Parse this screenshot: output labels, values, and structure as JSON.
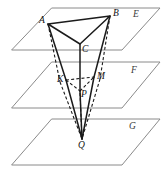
{
  "figure": {
    "type": "geometry-diagram",
    "background_color": "#ffffff",
    "stroke_color": "#1b1b1b",
    "plane_stroke_color": "#8a8a8a",
    "planes": [
      {
        "id": "plane-e",
        "label": "E",
        "label_x": 133,
        "label_y": 10,
        "outline": "52,8 160,8 122,50 12,50"
      },
      {
        "id": "plane-f",
        "label": "F",
        "label_x": 131,
        "label_y": 66,
        "outline": "52,62 160,62 122,108 12,108"
      },
      {
        "id": "plane-g",
        "label": "G",
        "label_x": 129,
        "label_y": 122,
        "outline": "52,119 160,119 122,165 12,165"
      }
    ],
    "points": [
      {
        "id": "A",
        "label": "A",
        "x": 48,
        "y": 24,
        "label_x": 39,
        "label_y": 16
      },
      {
        "id": "B",
        "label": "B",
        "x": 110,
        "y": 16,
        "label_x": 113,
        "label_y": 9
      },
      {
        "id": "C",
        "label": "C",
        "x": 80,
        "y": 44,
        "label_x": 82,
        "label_y": 45
      },
      {
        "id": "K",
        "label": "K",
        "x": 66,
        "y": 80,
        "label_x": 57,
        "label_y": 75
      },
      {
        "id": "M",
        "label": "M",
        "x": 94,
        "y": 77,
        "label_x": 97,
        "label_y": 72
      },
      {
        "id": "P",
        "label": "P",
        "x": 80,
        "y": 91,
        "label_x": 81,
        "label_y": 90
      },
      {
        "id": "Q",
        "label": "Q",
        "x": 82,
        "y": 139,
        "label_x": 78,
        "label_y": 141
      }
    ],
    "segments": [
      {
        "id": "AB",
        "from": "A",
        "to": "B",
        "style": "solid"
      },
      {
        "id": "AC",
        "from": "A",
        "to": "C",
        "style": "solid"
      },
      {
        "id": "BC",
        "from": "B",
        "to": "C",
        "style": "solid"
      },
      {
        "id": "KM",
        "from": "K",
        "to": "M",
        "style": "dashed"
      },
      {
        "id": "KP",
        "from": "K",
        "to": "P",
        "style": "dashed"
      },
      {
        "id": "PM",
        "from": "P",
        "to": "M",
        "style": "dashed"
      },
      {
        "id": "AK",
        "from": "A",
        "to": "K",
        "style": "dashed"
      },
      {
        "id": "BM",
        "from": "B",
        "to": "M",
        "style": "dashed"
      },
      {
        "id": "CP",
        "from": "C",
        "to": "P",
        "style": "solid"
      },
      {
        "id": "KQ",
        "from": "K",
        "to": "Q",
        "style": "dashed"
      },
      {
        "id": "MQ",
        "from": "M",
        "to": "Q",
        "style": "dashed"
      },
      {
        "id": "PQ",
        "from": "P",
        "to": "Q",
        "style": "solid"
      },
      {
        "id": "AQ-upper",
        "from": "A",
        "to": "K",
        "style": "solid-edge"
      },
      {
        "id": "BQ-upper",
        "from": "B",
        "to": "M",
        "style": "solid-edge"
      }
    ]
  }
}
